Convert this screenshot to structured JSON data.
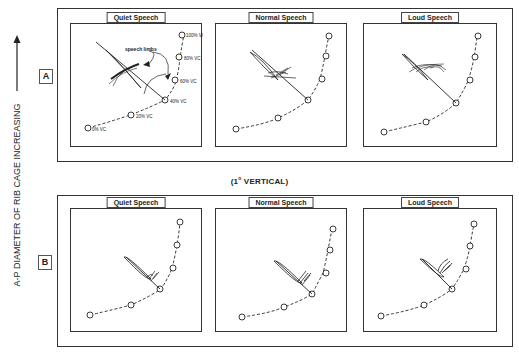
{
  "figure": {
    "y_axis_label": "A-P DIAMETER OF RIB CAGE INCREASING",
    "middle_caption_prefix": "(1",
    "middle_caption_degree": "o",
    "middle_caption_suffix": " VERTICAL)",
    "rows": [
      {
        "tag": "A",
        "panels": [
          {
            "title": "Quiet Speech",
            "annotation": "speech limbs"
          },
          {
            "title": "Normal Speech"
          },
          {
            "title": "Loud Speech"
          }
        ]
      },
      {
        "tag": "B",
        "panels": [
          {
            "title": "Quiet Speech"
          },
          {
            "title": "Normal Speech"
          },
          {
            "title": "Loud Speech"
          }
        ]
      }
    ],
    "relaxation_points": [
      "0% VC",
      "20% VC",
      "40% VC",
      "60% VC",
      "80% VC",
      "100% VC"
    ],
    "colors": {
      "line": "#222222",
      "background": "#ffffff"
    }
  }
}
